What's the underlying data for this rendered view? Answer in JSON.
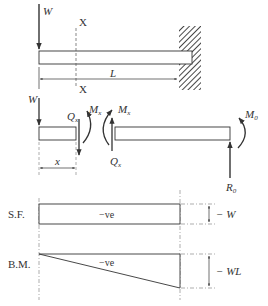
{
  "figure": {
    "type": "cantilever beam with end point load",
    "colors": {
      "line": "#333333",
      "background": "#ffffff"
    }
  },
  "top_diagram": {
    "load_label": "W",
    "section_label_top": "X",
    "section_label_bottom": "X",
    "length_label": "L",
    "support": "fixed wall (right end)"
  },
  "free_body": {
    "left_load_label": "W",
    "shear_left": {
      "symbol": "Q",
      "subscript": "x"
    },
    "moment_left": {
      "symbol": "M",
      "subscript": "x"
    },
    "moment_right": {
      "symbol": "M",
      "subscript": "x"
    },
    "shear_right": {
      "symbol": "Q",
      "subscript": "x"
    },
    "distance_label": "x",
    "reaction_moment": {
      "symbol": "M",
      "subscript": "0"
    },
    "reaction_force": {
      "symbol": "R",
      "subscript": "0"
    }
  },
  "sf_diagram": {
    "row_label": "S.F.",
    "sign_label": "−ve",
    "magnitude_label": "− W"
  },
  "bm_diagram": {
    "row_label": "B.M.",
    "sign_label": "−ve",
    "magnitude_label": "− WL"
  }
}
